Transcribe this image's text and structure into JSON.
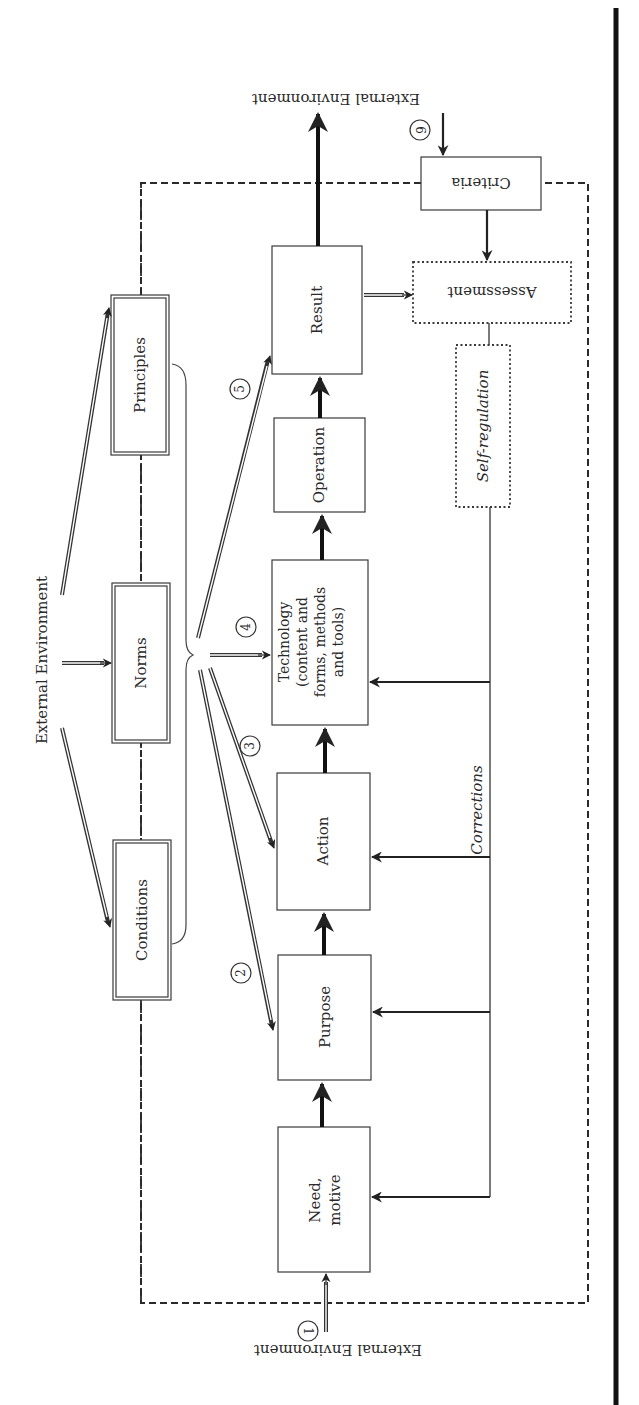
{
  "diagram": {
    "orientation": "rotated 90 degrees (book page scanned sideways)",
    "external_environment_labels": {
      "top": "External Environment",
      "left": "External Environment",
      "bottom": "External Environment"
    },
    "constraint_boxes": [
      {
        "id": "principles",
        "label": "Principles"
      },
      {
        "id": "norms",
        "label": "Norms"
      },
      {
        "id": "conditions",
        "label": "Conditions"
      }
    ],
    "process_boxes": [
      {
        "id": "need",
        "label_line1": "Need,",
        "label_line2": "motive"
      },
      {
        "id": "purpose",
        "label": "Purpose"
      },
      {
        "id": "action",
        "label": "Action"
      },
      {
        "id": "technology",
        "label_line1": "Technology",
        "label_line2": "(content and",
        "label_line3": "forms, methods",
        "label_line4": "and tools)"
      },
      {
        "id": "operation",
        "label": "Operation"
      },
      {
        "id": "result",
        "label": "Result"
      }
    ],
    "evaluation_boxes": {
      "criteria": "Criteria",
      "assessment": "Assessment",
      "self_regulation": "Self-regulation"
    },
    "feedback_label": "Corrections",
    "numbered_markers": [
      "1",
      "2",
      "3",
      "4",
      "5",
      "6"
    ],
    "colors": {
      "ink": "#2a2a2a",
      "background": "#ffffff"
    }
  }
}
